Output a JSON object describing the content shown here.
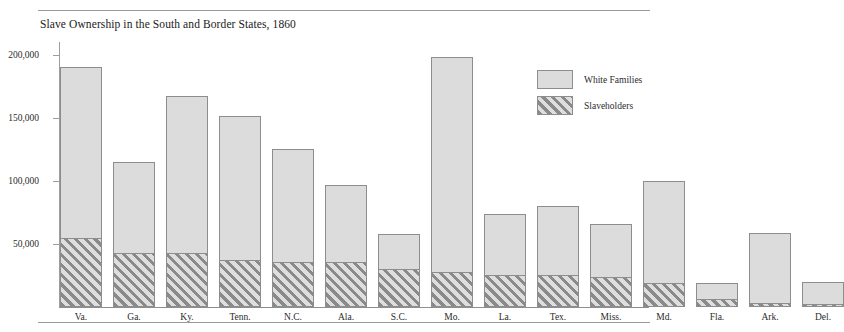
{
  "chart_data": {
    "type": "bar",
    "subtype": "stacked-bar",
    "title": "Slave Ownership in the South and Border States, 1860",
    "xlabel": "",
    "ylabel": "",
    "ylim": [
      0,
      210000
    ],
    "yticks": [
      50000,
      100000,
      150000,
      200000
    ],
    "ytick_labels": [
      "50,000",
      "100,000",
      "150,000",
      "200,000"
    ],
    "grid": false,
    "legend_position": "upper-right",
    "categories": [
      "Va.",
      "Ga.",
      "Ky.",
      "Tenn.",
      "N.C.",
      "Ala.",
      "S.C.",
      "Mo.",
      "La.",
      "Tex.",
      "Miss.",
      "Md.",
      "Fla.",
      "Ark.",
      "Del."
    ],
    "series": [
      {
        "name": "White Families",
        "color": "#dcdcdc",
        "pattern": "solid",
        "values": [
          190000,
          115000,
          167000,
          151000,
          125000,
          97000,
          58000,
          198000,
          74000,
          80000,
          66000,
          100000,
          19000,
          59000,
          20000
        ]
      },
      {
        "name": "Slaveholders",
        "color": "#8a8a8a",
        "pattern": "diagonal-hatch",
        "values": [
          55000,
          43000,
          43000,
          37000,
          36000,
          36000,
          30000,
          28000,
          25000,
          25000,
          24000,
          19000,
          6000,
          3500,
          2000
        ]
      }
    ]
  },
  "legend": {
    "items": [
      {
        "label": "White Families"
      },
      {
        "label": "Slaveholders"
      }
    ]
  },
  "colors": {
    "bar_fill": "#dcdcdc",
    "bar_border": "#8d8d8d",
    "hatch": "#8a8a8a",
    "axis": "#9d9d9d",
    "rule": "#9a9a9a",
    "text": "#2b2b2b"
  }
}
